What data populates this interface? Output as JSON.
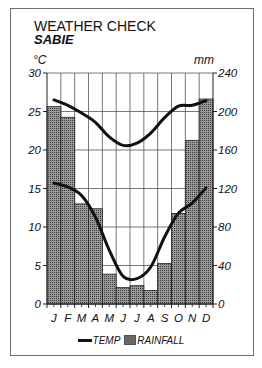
{
  "title": "WEATHER CHECK",
  "subtitle": "SABIE",
  "left_unit": "°C",
  "right_unit": "mm",
  "legend": {
    "temp_label": "TEMP",
    "rainfall_label": "RAINFALL"
  },
  "chart_data": {
    "type": "bar+line",
    "title": "WEATHER CHECK",
    "subtitle": "SABIE",
    "categories": [
      "J",
      "F",
      "M",
      "A",
      "M",
      "J",
      "J",
      "A",
      "S",
      "O",
      "N",
      "D"
    ],
    "series": [
      {
        "name": "RAINFALL",
        "type": "bar",
        "axis": "right",
        "unit": "mm",
        "values": [
          205,
          194,
          104,
          99,
          31,
          17,
          19,
          14,
          42,
          94,
          170,
          213
        ]
      },
      {
        "name": "TEMP max",
        "type": "line",
        "axis": "left",
        "unit": "°C",
        "values": [
          26.5,
          25.8,
          24.8,
          23.6,
          21.7,
          20.6,
          20.9,
          22.2,
          24.2,
          25.7,
          25.8,
          26.4
        ]
      },
      {
        "name": "TEMP min",
        "type": "line",
        "axis": "left",
        "unit": "°C",
        "values": [
          15.7,
          15.2,
          14.1,
          11.3,
          7.0,
          3.6,
          3.3,
          4.8,
          8.7,
          11.8,
          13.1,
          15.1
        ]
      }
    ],
    "y_left": {
      "label": "°C",
      "ticks": [
        0,
        5,
        10,
        15,
        20,
        25,
        30
      ],
      "range": [
        0,
        30
      ]
    },
    "y_right": {
      "label": "mm",
      "ticks": [
        0,
        40,
        80,
        120,
        160,
        200,
        240
      ],
      "range": [
        0,
        240
      ]
    },
    "grid": true,
    "legend_position": "bottom",
    "legend": [
      "TEMP",
      "RAINFALL"
    ]
  }
}
